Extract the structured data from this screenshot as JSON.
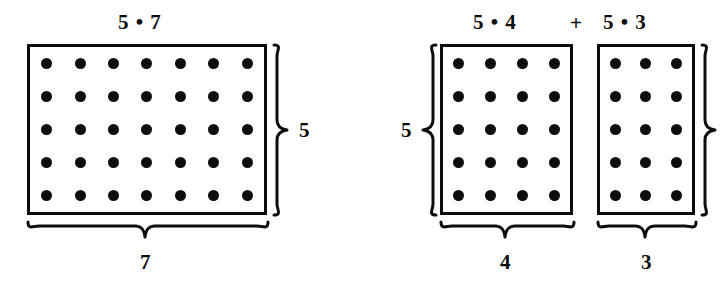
{
  "figure": {
    "title_hidden": "",
    "background_color": "#ffffff",
    "ink_color": "#0d0d0d"
  },
  "left_group": {
    "top_label": "5 • 7",
    "right_brace_label": "5",
    "bottom_brace_label": "7",
    "array": {
      "rows": 5,
      "cols": 7,
      "dot_count": 35
    }
  },
  "operator": {
    "symbol": "+"
  },
  "right_group": {
    "left_brace_label": "5",
    "first": {
      "top_label": "5 • 4",
      "bottom_brace_label": "4",
      "array": {
        "rows": 5,
        "cols": 4,
        "dot_count": 20
      }
    },
    "second": {
      "top_label": "5 • 3",
      "bottom_brace_label": "3",
      "array": {
        "rows": 5,
        "cols": 3,
        "dot_count": 15
      }
    },
    "right_brace_label": ""
  }
}
